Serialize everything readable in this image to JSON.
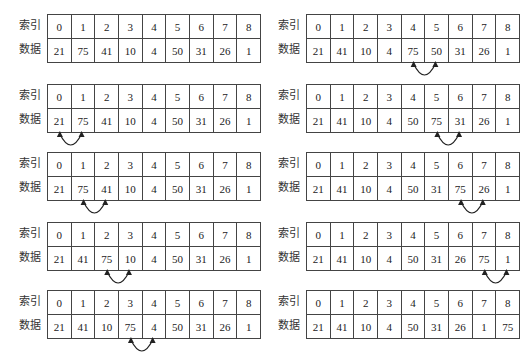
{
  "row_labels": {
    "index": "索引",
    "data": "数据"
  },
  "panels": [
    {
      "step": 1,
      "index": [
        "0",
        "1",
        "2",
        "3",
        "4",
        "5",
        "6",
        "7",
        "8"
      ],
      "data": [
        "21",
        "75",
        "41",
        "10",
        "4",
        "50",
        "31",
        "26",
        "1"
      ],
      "swap": null
    },
    {
      "step": 2,
      "index": [
        "0",
        "1",
        "2",
        "3",
        "4",
        "5",
        "6",
        "7",
        "8"
      ],
      "data": [
        "21",
        "75",
        "41",
        "10",
        "4",
        "50",
        "31",
        "26",
        "1"
      ],
      "swap": [
        0,
        1
      ]
    },
    {
      "step": 3,
      "index": [
        "0",
        "1",
        "2",
        "3",
        "4",
        "5",
        "6",
        "7",
        "8"
      ],
      "data": [
        "21",
        "75",
        "41",
        "10",
        "4",
        "50",
        "31",
        "26",
        "1"
      ],
      "swap": [
        1,
        2
      ]
    },
    {
      "step": 4,
      "index": [
        "0",
        "1",
        "2",
        "3",
        "4",
        "5",
        "6",
        "7",
        "8"
      ],
      "data": [
        "21",
        "41",
        "75",
        "10",
        "4",
        "50",
        "31",
        "26",
        "1"
      ],
      "swap": [
        2,
        3
      ]
    },
    {
      "step": 5,
      "index": [
        "0",
        "1",
        "2",
        "3",
        "4",
        "5",
        "6",
        "7",
        "8"
      ],
      "data": [
        "21",
        "41",
        "10",
        "75",
        "4",
        "50",
        "31",
        "26",
        "1"
      ],
      "swap": [
        3,
        4
      ]
    },
    {
      "step": 6,
      "index": [
        "0",
        "1",
        "2",
        "3",
        "4",
        "5",
        "6",
        "7",
        "8"
      ],
      "data": [
        "21",
        "41",
        "10",
        "4",
        "75",
        "50",
        "31",
        "26",
        "1"
      ],
      "swap": [
        4,
        5
      ]
    },
    {
      "step": 7,
      "index": [
        "0",
        "1",
        "2",
        "3",
        "4",
        "5",
        "6",
        "7",
        "8"
      ],
      "data": [
        "21",
        "41",
        "10",
        "4",
        "50",
        "75",
        "31",
        "26",
        "1"
      ],
      "swap": [
        5,
        6
      ]
    },
    {
      "step": 8,
      "index": [
        "0",
        "1",
        "2",
        "3",
        "4",
        "5",
        "6",
        "7",
        "8"
      ],
      "data": [
        "21",
        "41",
        "10",
        "4",
        "50",
        "31",
        "75",
        "26",
        "1"
      ],
      "swap": [
        6,
        7
      ]
    },
    {
      "step": 9,
      "index": [
        "0",
        "1",
        "2",
        "3",
        "4",
        "5",
        "6",
        "7",
        "8"
      ],
      "data": [
        "21",
        "41",
        "10",
        "4",
        "50",
        "31",
        "26",
        "75",
        "1"
      ],
      "swap": [
        7,
        8
      ]
    },
    {
      "step": 10,
      "index": [
        "0",
        "1",
        "2",
        "3",
        "4",
        "5",
        "6",
        "7",
        "8"
      ],
      "data": [
        "21",
        "41",
        "10",
        "4",
        "50",
        "31",
        "26",
        "1",
        "75"
      ],
      "swap": null
    }
  ]
}
